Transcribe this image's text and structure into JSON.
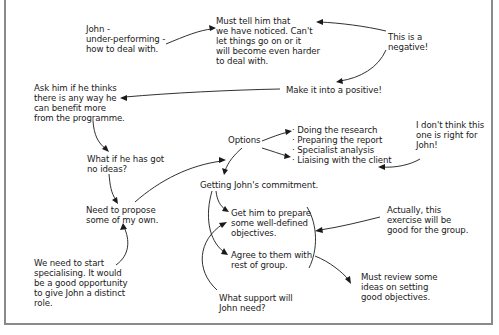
{
  "diagram": {
    "type": "mind-map notes",
    "nodes": {
      "john": "John -\nunder-performing -\nhow to deal with.",
      "must_tell": "Must tell him that\nwe have noticed. Can't\nlet things go on or it\nwill become even harder\nto deal with.",
      "negative": "This is a\nnegative!",
      "positive": "Make it into a positive!",
      "ask_him": "Ask him if he thinks\nthere is any way he\ncan benefit more\nfrom the programme.",
      "no_ideas": "What if he has got\nno ideas?",
      "propose": "Need to propose\nsome of my own.",
      "specialising": "We need to start\nspecialising. It would\nbe a good opportunity\nto give John a distinct\nrole.",
      "options": "Options",
      "options_list": [
        "· Doing the research",
        "· Preparing the report",
        "· Specialist analysis",
        "· Liaising with the client"
      ],
      "not_right": "I don't think this\none is right for\nJohn!",
      "commitment": "Getting John's commitment.",
      "prepare": "Get him to prepare\nsome well-defined\nobjectives.",
      "agree": "Agree to them with\nrest of group.",
      "support": "What support will\nJohn need?",
      "good_for_group": "Actually, this\nexercise will be\ngood for the group.",
      "review": "Must review some\nideas on setting\ngood objectives."
    }
  }
}
